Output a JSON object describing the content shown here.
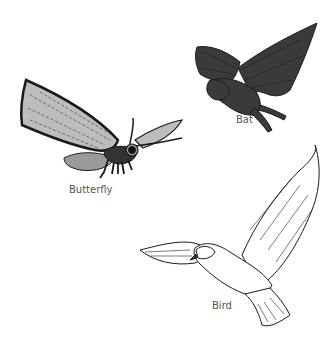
{
  "figure": {
    "animals": [
      {
        "id": "butterfly",
        "label": "Butterfly"
      },
      {
        "id": "bat",
        "label": "Bat"
      },
      {
        "id": "bird",
        "label": "Bird"
      }
    ]
  },
  "colors": {
    "background": "#ffffff",
    "ink": "#1a1a1a",
    "bat_fill": "#3a3a3a",
    "wing_fill": "#bdbdbd",
    "label": "#555555"
  }
}
